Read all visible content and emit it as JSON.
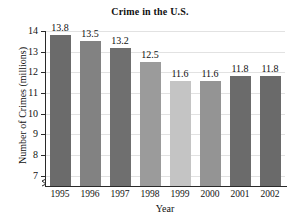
{
  "chart_data": {
    "type": "bar",
    "title": "Crime in the U.S.",
    "xlabel": "Year",
    "ylabel": "Number of Crimes (millions)",
    "categories": [
      "1995",
      "1996",
      "1997",
      "1998",
      "1999",
      "2000",
      "2001",
      "2002"
    ],
    "values": [
      13.8,
      13.5,
      13.2,
      12.5,
      11.6,
      11.6,
      11.8,
      11.8
    ],
    "value_labels": [
      "13.8",
      "13.5",
      "13.2",
      "12.5",
      "11.6",
      "11.6",
      "11.8",
      "11.8"
    ],
    "bar_colors": [
      "#6b6b6b",
      "#828282",
      "#6f6f6f",
      "#9b9b9b",
      "#c4c4c4",
      "#949494",
      "#6b6b6b",
      "#6a6a6a"
    ],
    "ylim": [
      6.5,
      14
    ],
    "y_ticks": [
      14,
      13,
      12,
      11,
      10,
      9,
      8,
      7
    ],
    "y_tick_labels": [
      "14",
      "13",
      "12",
      "11",
      "10",
      "9",
      "8",
      "7"
    ],
    "grid": true,
    "grid_color": "#e2e2e2",
    "axis_color": "#2a2a2a",
    "axis_break": true,
    "legend": null,
    "legend_position": "none"
  }
}
